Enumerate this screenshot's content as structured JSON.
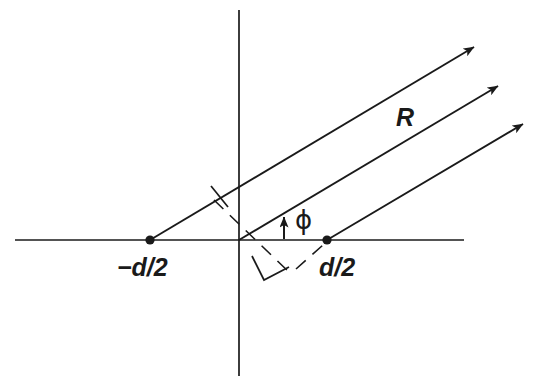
{
  "figure": {
    "background_color": "#ffffff",
    "stroke_color": "#1a1a1a",
    "width": 542,
    "height": 385
  },
  "labels": {
    "left_element": "−d/2",
    "right_element": "d/2",
    "ray_length": "R",
    "angle": "ϕ"
  },
  "axes": {
    "horizontal": {
      "x1": 15,
      "y1": 240,
      "x2": 464,
      "y2": 240
    },
    "vertical": {
      "x1": 239,
      "y1": 10,
      "x2": 239,
      "y2": 376
    },
    "origin": {
      "x": 239,
      "y": 240
    }
  },
  "elements": [
    {
      "name": "left-element-point",
      "x": 150,
      "y": 240,
      "label": "−d/2"
    },
    {
      "name": "right-element-point",
      "x": 327,
      "y": 240,
      "label": "d/2"
    }
  ],
  "rays": [
    {
      "name": "ray-from-left-element",
      "x1": 150,
      "y1": 240,
      "x2": 479,
      "y2": 44
    },
    {
      "name": "ray-from-origin",
      "x1": 239,
      "y1": 240,
      "x2": 503,
      "y2": 83
    },
    {
      "name": "ray-from-right-element",
      "x1": 327,
      "y1": 240,
      "x2": 528,
      "y2": 121
    }
  ],
  "ray_angle_degrees": 30.8,
  "construction": {
    "dashed_wavefront": {
      "x1": 214,
      "y1": 200,
      "x2": 290,
      "y2": 273
    },
    "dashed_to_right_element": {
      "x1": 297,
      "y1": 268,
      "x2": 322,
      "y2": 246
    },
    "perpendicular_tick": {
      "x1": 211,
      "y1": 187,
      "x2": 227,
      "y2": 206
    },
    "right_angle_marker": [
      {
        "x": 252,
        "y": 256
      },
      {
        "x": 263,
        "y": 279
      },
      {
        "x": 288,
        "y": 267
      }
    ]
  },
  "angle_indicator": {
    "name": "phi-angle-arrow",
    "x": 284,
    "y_base": 239,
    "y_tip": 213
  },
  "label_positions": {
    "left_element": {
      "x": 117,
      "y": 275
    },
    "right_element": {
      "x": 319,
      "y": 275
    },
    "ray_length": {
      "x": 396,
      "y": 125
    },
    "angle": {
      "x": 296,
      "y": 228
    }
  }
}
